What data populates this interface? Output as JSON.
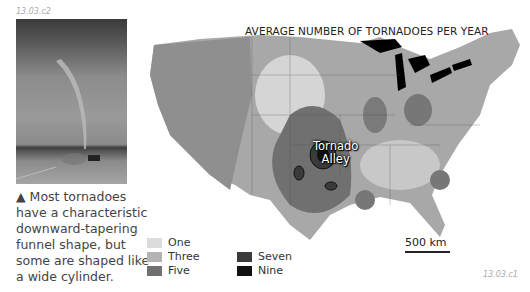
{
  "figure_ids": {
    "photo": "13.03.c2",
    "map": "13.03.c1"
  },
  "photo": {
    "subject": "tornado-funnel-photo"
  },
  "caption": {
    "marker": "▲",
    "text": "Most tornadoes have a characteristic downward-tapering funnel shape, but some are shaped like a wide cylinder."
  },
  "map": {
    "title": "AVERAGE NUMBER OF TORNADOES PER YEAR",
    "region_label_line1": "Tornado",
    "region_label_line2": "Alley",
    "scale_label": "500 km",
    "legend": [
      {
        "label": "One",
        "color": "#dcdcdc"
      },
      {
        "label": "Three",
        "color": "#b4b4b4"
      },
      {
        "label": "Five",
        "color": "#707070"
      },
      {
        "label": "Seven",
        "color": "#3a3a3a"
      },
      {
        "label": "Nine",
        "color": "#111111"
      }
    ]
  }
}
